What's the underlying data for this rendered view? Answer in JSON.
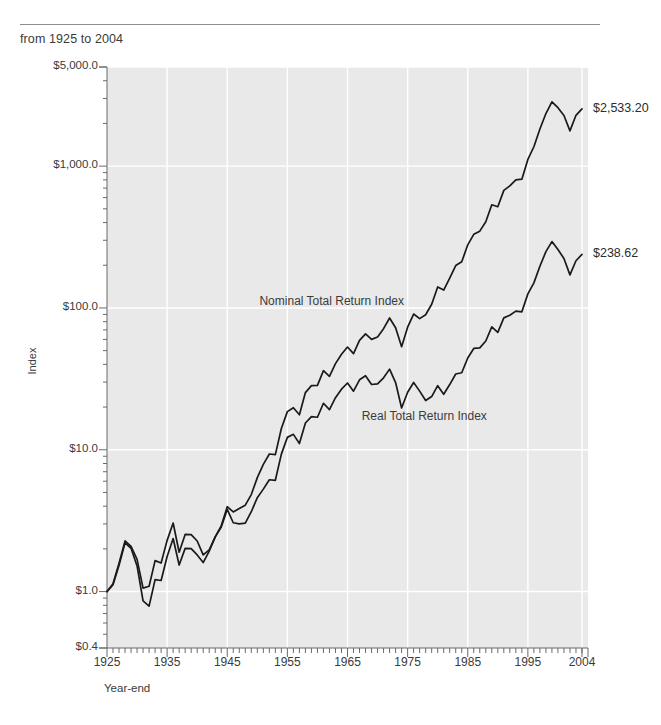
{
  "header": {
    "subtitle": "from 1925 to 2004"
  },
  "chart_data": {
    "type": "line",
    "title": "",
    "subtitle": "from 1925 to 2004",
    "xlabel": "Year-end",
    "ylabel": "Index",
    "yscale": "log",
    "ylim": [
      0.4,
      5000
    ],
    "xlim": [
      1925,
      2005
    ],
    "grid": true,
    "legend_position": "inline-annotation",
    "y_tick_labels": [
      "$5,000.0",
      "$1,000.0",
      "$100.0",
      "$10.0",
      "$1.0",
      "$0.4"
    ],
    "y_tick_values": [
      5000,
      1000,
      100,
      10,
      1,
      0.4
    ],
    "x_tick_labels": [
      "1925",
      "1935",
      "1945",
      "1955",
      "1965",
      "1975",
      "1985",
      "1995",
      "2004"
    ],
    "x_tick_values": [
      1925,
      1935,
      1945,
      1955,
      1965,
      1975,
      1985,
      1995,
      2004
    ],
    "end_labels": [
      {
        "series": "Nominal Total Return Index",
        "text": "$2,533.20",
        "value": 2533.2
      },
      {
        "series": "Real Total Return Index",
        "text": "$238.62",
        "value": 238.62
      }
    ],
    "annotations": [
      {
        "text": "Nominal Total Return Index",
        "x": 1962,
        "y": 110
      },
      {
        "text": "Real Total Return Index",
        "x": 1979,
        "y": 17
      }
    ],
    "x": [
      1925,
      1926,
      1927,
      1928,
      1929,
      1930,
      1931,
      1932,
      1933,
      1934,
      1935,
      1936,
      1937,
      1938,
      1939,
      1940,
      1941,
      1942,
      1943,
      1944,
      1945,
      1946,
      1947,
      1948,
      1949,
      1950,
      1951,
      1952,
      1953,
      1954,
      1955,
      1956,
      1957,
      1958,
      1959,
      1960,
      1961,
      1962,
      1963,
      1964,
      1965,
      1966,
      1967,
      1968,
      1969,
      1970,
      1971,
      1972,
      1973,
      1974,
      1975,
      1976,
      1977,
      1978,
      1979,
      1980,
      1981,
      1982,
      1983,
      1984,
      1985,
      1986,
      1987,
      1988,
      1989,
      1990,
      1991,
      1992,
      1993,
      1994,
      1995,
      1996,
      1997,
      1998,
      1999,
      2000,
      2001,
      2002,
      2003,
      2004
    ],
    "series": [
      {
        "name": "Nominal Total Return Index",
        "color": "#1a1a1a",
        "values": [
          1.0,
          1.116,
          1.535,
          2.204,
          2.018,
          1.516,
          0.859,
          0.789,
          1.214,
          1.197,
          1.767,
          2.367,
          1.538,
          2.016,
          2.008,
          1.812,
          1.602,
          1.928,
          2.428,
          2.907,
          3.965,
          3.644,
          3.853,
          4.065,
          4.829,
          6.36,
          7.888,
          9.336,
          9.244,
          14.108,
          18.561,
          19.778,
          17.646,
          25.298,
          28.322,
          28.455,
          36.106,
          32.955,
          40.469,
          47.139,
          53.007,
          47.674,
          59.104,
          65.642,
          60.059,
          62.465,
          71.406,
          84.956,
          72.5,
          53.311,
          73.144,
          90.584,
          84.077,
          89.592,
          106.112,
          140.513,
          133.617,
          162.407,
          198.985,
          211.479,
          278.557,
          330.451,
          347.851,
          405.524,
          533.773,
          517.253,
          674.567,
          725.966,
          799.032,
          809.499,
          1113.917,
          1369.715,
          1826.636,
          2348.879,
          2842.799,
          2584.168,
          2277.082,
          1774.097,
          2282.238,
          2533.2
        ]
      },
      {
        "name": "Real Total Return Index",
        "color": "#1a1a1a",
        "values": [
          1.0,
          1.134,
          1.585,
          2.275,
          2.081,
          1.686,
          1.058,
          1.09,
          1.652,
          1.59,
          2.296,
          3.044,
          1.894,
          2.528,
          2.52,
          2.274,
          1.814,
          1.971,
          2.428,
          2.851,
          3.794,
          3.057,
          3.001,
          3.042,
          3.657,
          4.592,
          5.276,
          6.142,
          6.092,
          9.318,
          12.226,
          12.841,
          11.063,
          15.441,
          17.119,
          16.945,
          21.273,
          19.209,
          23.284,
          26.725,
          29.565,
          25.882,
          31.145,
          33.277,
          28.85,
          29.17,
          32.136,
          37.037,
          29.782,
          19.702,
          25.421,
          29.798,
          25.909,
          22.221,
          23.712,
          28.315,
          24.595,
          28.818,
          34.217,
          34.899,
          44.398,
          51.794,
          52.297,
          58.499,
          73.502,
          67.275,
          85.123,
          88.867,
          95.034,
          93.857,
          125.665,
          150.152,
          196.93,
          249.602,
          293.717,
          258.338,
          222.938,
          170.991,
          215.18,
          238.62
        ]
      }
    ]
  },
  "plot": {
    "bg_color": "#e9e9e9",
    "grid_color": "#ffffff",
    "line_color": "#1a1a1a",
    "axis_color": "#6a6a6a",
    "text_color": "#3b3b3b"
  }
}
